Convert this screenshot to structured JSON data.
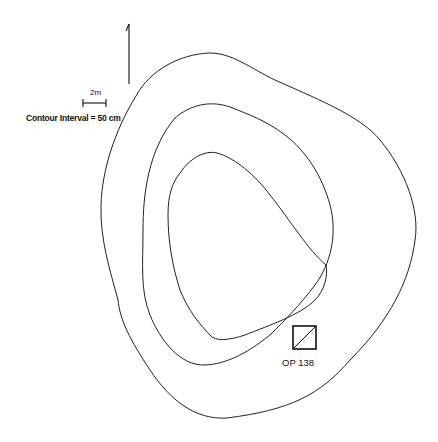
{
  "figure": {
    "north_arrow": "north-arrow",
    "scale_bar_label": "2m",
    "contour_interval_label": "Contour Interval = 50 cm",
    "operation_label": "OP 138",
    "line_color": "#222222",
    "background": "#ffffff",
    "contour_count": 3
  }
}
